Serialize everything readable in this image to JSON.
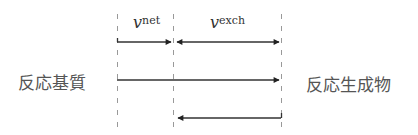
{
  "diagram": {
    "left_label": "反応基質",
    "right_label": "反応生成物",
    "rates": [
      {
        "symbol": "v",
        "superscript": "net"
      },
      {
        "symbol": "v",
        "superscript": "exch"
      }
    ],
    "dashed_lines_x": [
      117,
      173,
      281
    ],
    "arrows": [
      {
        "name": "net-forward",
        "from_x": 117,
        "to_x": 172,
        "y": 42,
        "heads": [
          "end"
        ]
      },
      {
        "name": "exchange-bidirectional",
        "from_x": 176,
        "to_x": 279,
        "y": 42,
        "heads": [
          "start",
          "end"
        ]
      },
      {
        "name": "total-forward",
        "from_x": 117,
        "to_x": 279,
        "y": 80,
        "heads": [
          "end"
        ]
      },
      {
        "name": "reverse",
        "from_x": 281,
        "to_x": 176,
        "y": 118,
        "heads": [
          "end"
        ]
      }
    ],
    "colors": {
      "line": "#333333",
      "dash": "#888888",
      "text": "#555555"
    }
  }
}
